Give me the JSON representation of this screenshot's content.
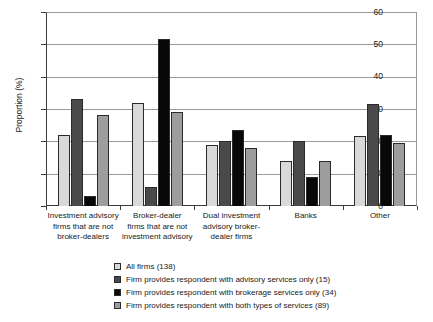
{
  "chart_data": {
    "type": "bar",
    "title": "",
    "xlabel": "",
    "ylabel": "Proportion (%)",
    "ylim": [
      0,
      60
    ],
    "yticks": [
      0,
      10,
      20,
      30,
      40,
      50,
      60
    ],
    "grid": true,
    "legend_position": "bottom",
    "categories": [
      "Investment advisory firms that are not broker-dealers",
      "Broker-dealer firms that are not investment advisory",
      "Dual investment advisory broker-dealer firms",
      "Banks",
      "Other"
    ],
    "category_lines": [
      [
        "Investment advisory",
        "firms that are not",
        "broker-dealers"
      ],
      [
        "Broker-dealer",
        "firms that are not",
        "investment advisory"
      ],
      [
        "Dual investment",
        "advisory broker-",
        "dealer firms"
      ],
      [
        "Banks"
      ],
      [
        "Other"
      ]
    ],
    "series": [
      {
        "name": "All firms (138)",
        "values": [
          22,
          32,
          19,
          14,
          21.5
        ]
      },
      {
        "name": "Firm provides respondent with advisory services only (15)",
        "values": [
          33,
          6,
          20,
          20,
          31.5
        ]
      },
      {
        "name": "Firm provides respondent with brokerage services only (34)",
        "values": [
          3,
          51.5,
          23.5,
          9,
          22
        ]
      },
      {
        "name": "Firm provides respondent with both types of services (89)",
        "values": [
          28,
          29,
          18,
          14,
          19.5
        ]
      }
    ]
  },
  "legend": {
    "items": [
      {
        "label": "All firms (138)",
        "color": "#d9d9d9"
      },
      {
        "label": "Firm provides respondent with advisory services only (15)",
        "color": "#4a4a4a"
      },
      {
        "label": "Firm provides respondent with brokerage services only (34)",
        "color": "#080808"
      },
      {
        "label": "Firm provides respondent with both types of services (89)",
        "color": "#9d9d9d"
      }
    ]
  }
}
